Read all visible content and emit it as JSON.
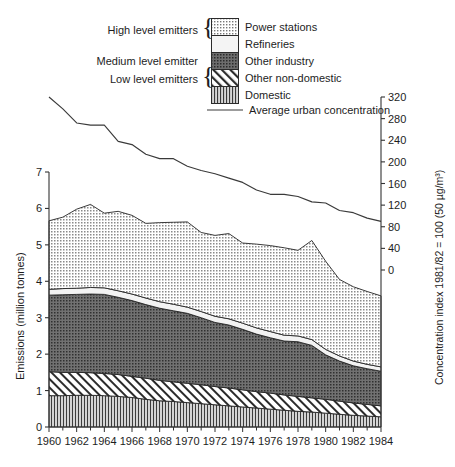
{
  "figure": {
    "legend": {
      "groups": [
        {
          "label": "High level emitters",
          "brace": "{"
        },
        {
          "label": "Medium level emitter",
          "brace": ""
        },
        {
          "label": "Low level emitters",
          "brace": "{"
        }
      ],
      "entries": [
        {
          "label": "Power stations",
          "pattern": "dots-medium",
          "color": "#b9b9b9"
        },
        {
          "label": "Refineries",
          "pattern": "plain-light",
          "color": "#f2f2f2"
        },
        {
          "label": "Other industry",
          "pattern": "dots-dark",
          "color": "#6e6e6e"
        },
        {
          "label": "Other non-domestic",
          "pattern": "diagonal",
          "color": "#ffffff"
        },
        {
          "label": "Domestic",
          "pattern": "vertical",
          "color": "#d2d2d2"
        }
      ],
      "line_entry": {
        "label": "Average urban concentration",
        "color": "#3a3a3a"
      }
    },
    "axes": {
      "left": {
        "title": "Emissions (million tonnes)",
        "ticks": [
          0,
          1,
          2,
          3,
          4,
          5,
          6,
          7
        ],
        "min": 0,
        "max": 7
      },
      "right": {
        "title": "Concentration index 1981/82 = 100 (50 µg/m³)",
        "ticks": [
          0,
          40,
          80,
          120,
          160,
          200,
          240,
          280,
          320
        ],
        "min": 0,
        "max": 320
      },
      "bottom": {
        "ticks": [
          "1960",
          "1962",
          "1964",
          "1966",
          "1968",
          "1970",
          "1972",
          "1974",
          "1976",
          "1978",
          "1980",
          "1982",
          "1984"
        ],
        "minor_step": 1,
        "min": 1960,
        "max": 1984
      }
    }
  },
  "chart_data": {
    "type": "area",
    "title": "",
    "xlabel": "",
    "ylabel": "Emissions (million tonnes)",
    "y2label": "Concentration index 1981/82 = 100 (50 µg/m³)",
    "ylim": [
      0,
      7
    ],
    "y2lim": [
      0,
      320
    ],
    "xlim": [
      1960,
      1984
    ],
    "grid": false,
    "legend_position": "top",
    "stacked": true,
    "x": [
      1960,
      1961,
      1962,
      1963,
      1964,
      1965,
      1966,
      1967,
      1968,
      1969,
      1970,
      1971,
      1972,
      1973,
      1974,
      1975,
      1976,
      1977,
      1978,
      1979,
      1980,
      1981,
      1982,
      1983,
      1984
    ],
    "series": [
      {
        "name": "Domestic",
        "pattern": "vertical",
        "color": "#d2d2d2",
        "values": [
          0.86,
          0.86,
          0.87,
          0.87,
          0.86,
          0.84,
          0.81,
          0.76,
          0.72,
          0.7,
          0.67,
          0.64,
          0.61,
          0.58,
          0.55,
          0.52,
          0.49,
          0.46,
          0.43,
          0.41,
          0.38,
          0.35,
          0.32,
          0.3,
          0.28
        ]
      },
      {
        "name": "Other non-domestic",
        "pattern": "diagonal",
        "color": "#ffffff",
        "values": [
          0.66,
          0.64,
          0.63,
          0.62,
          0.61,
          0.6,
          0.58,
          0.58,
          0.56,
          0.54,
          0.53,
          0.52,
          0.5,
          0.49,
          0.47,
          0.45,
          0.44,
          0.42,
          0.41,
          0.39,
          0.38,
          0.36,
          0.34,
          0.32,
          0.3
        ]
      },
      {
        "name": "Other industry",
        "pattern": "dots-dark",
        "color": "#6e6e6e",
        "values": [
          2.1,
          2.13,
          2.14,
          2.16,
          2.17,
          2.12,
          2.08,
          2.02,
          1.98,
          1.95,
          1.92,
          1.84,
          1.76,
          1.73,
          1.66,
          1.58,
          1.52,
          1.48,
          1.5,
          1.44,
          1.22,
          1.1,
          1.02,
          0.98,
          0.95
        ]
      },
      {
        "name": "Refineries",
        "pattern": "plain-light",
        "color": "#f2f2f2",
        "values": [
          0.16,
          0.17,
          0.17,
          0.18,
          0.18,
          0.18,
          0.18,
          0.18,
          0.18,
          0.18,
          0.17,
          0.17,
          0.17,
          0.17,
          0.17,
          0.17,
          0.17,
          0.16,
          0.16,
          0.16,
          0.15,
          0.14,
          0.13,
          0.12,
          0.12
        ]
      },
      {
        "name": "Power stations",
        "pattern": "dots-medium",
        "color": "#b9b9b9",
        "values": [
          1.88,
          1.96,
          2.17,
          2.28,
          2.05,
          2.18,
          2.16,
          2.05,
          2.17,
          2.25,
          2.34,
          2.17,
          2.22,
          2.34,
          2.2,
          2.3,
          2.36,
          2.4,
          2.35,
          2.72,
          2.42,
          2.1,
          2.04,
          2.0,
          1.95
        ]
      }
    ],
    "line_series": {
      "name": "Average urban concentration",
      "axis": "right",
      "color": "#3a3a3a",
      "x": [
        1960,
        1961,
        1962,
        1963,
        1964,
        1965,
        1966,
        1967,
        1968,
        1969,
        1970,
        1971,
        1972,
        1973,
        1974,
        1975,
        1976,
        1977,
        1978,
        1979,
        1980,
        1981,
        1982,
        1983,
        1984
      ],
      "values": [
        320,
        298,
        272,
        268,
        268,
        238,
        232,
        214,
        206,
        206,
        192,
        184,
        178,
        170,
        162,
        148,
        140,
        140,
        136,
        126,
        124,
        110,
        106,
        96,
        90
      ]
    },
    "stack_totals": [
      5.66,
      5.76,
      5.98,
      6.11,
      5.87,
      5.92,
      5.81,
      5.59,
      5.61,
      5.62,
      5.63,
      5.34,
      5.26,
      5.31,
      5.05,
      5.02,
      4.98,
      4.92,
      4.85,
      5.12,
      4.55,
      4.05,
      3.85,
      3.72,
      3.6
    ]
  }
}
